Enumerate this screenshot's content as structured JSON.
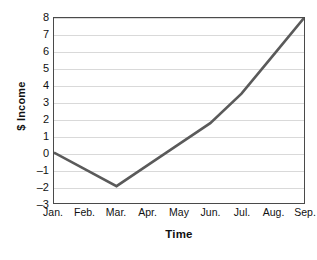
{
  "chart_data": {
    "type": "line",
    "title": "",
    "xlabel": "Time",
    "ylabel": "$ Income",
    "categories": [
      "Jan.",
      "Feb.",
      "Mar.",
      "Apr.",
      "May",
      "Jun.",
      "Jul.",
      "Aug.",
      "Sep."
    ],
    "values": [
      0,
      -1,
      -2,
      -0.75,
      0.5,
      1.75,
      3.5,
      5.75,
      8
    ],
    "series": [
      {
        "name": "$ Income",
        "values": [
          0,
          -1,
          -2,
          -0.75,
          0.5,
          1.75,
          3.5,
          5.75,
          8
        ]
      }
    ],
    "yticks": [
      "8",
      "7",
      "6",
      "5",
      "4",
      "3",
      "2",
      "1",
      "0",
      "–1",
      "–2",
      "–3"
    ],
    "ytick_values": [
      8,
      7,
      6,
      5,
      4,
      3,
      2,
      1,
      0,
      -1,
      -2,
      -3
    ],
    "ylim": [
      -3,
      8
    ],
    "xlim": [
      0,
      8
    ],
    "grid": "horizontal",
    "legend": "none",
    "line_color": "#5a5a5a",
    "grid_color": "#d9d9d9",
    "frame_color": "#4a4a4a",
    "background_color": "#ffffff"
  },
  "axes": {
    "y_title": "$ Income",
    "x_title": "Time"
  }
}
